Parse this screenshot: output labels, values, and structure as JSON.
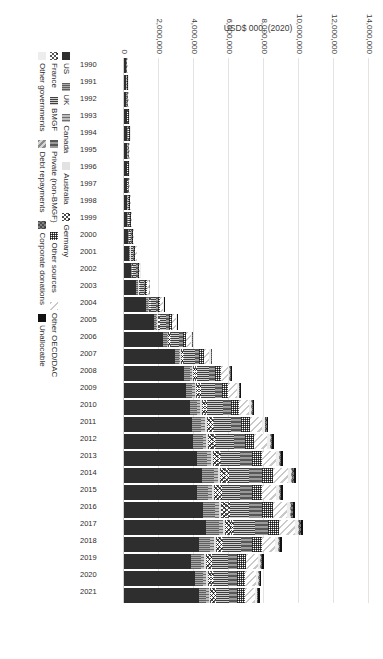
{
  "chart_data": {
    "type": "bar",
    "subtype": "stacked-horizontal-rotated",
    "title": "",
    "xlabel": "",
    "ylabel": "USD$ 000, (2020)",
    "ylim": [
      0,
      14000000
    ],
    "grid": true,
    "legend_position": "bottom",
    "yticks": [
      "0",
      "2,000,000",
      "4,000,000",
      "6,000,000",
      "8,000,000",
      "10,000,000",
      "12,000,000",
      "14,000,000"
    ],
    "ytick_values": [
      0,
      2000000,
      4000000,
      6000000,
      8000000,
      10000000,
      12000000,
      14000000
    ],
    "categories": [
      "1990",
      "1991",
      "1992",
      "1993",
      "1994",
      "1995",
      "1996",
      "1997",
      "1998",
      "1999",
      "2000",
      "2001",
      "2002",
      "2003",
      "2004",
      "2005",
      "2006",
      "2007",
      "2008",
      "2009",
      "2010",
      "2011",
      "2012",
      "2013",
      "2014",
      "2015",
      "2016",
      "2017",
      "2018",
      "2019",
      "2020",
      "2021"
    ],
    "series": [
      {
        "name": "US",
        "key": "us",
        "values": [
          95000,
          120000,
          140000,
          150000,
          185000,
          165000,
          150000,
          155000,
          165000,
          195000,
          235000,
          300000,
          390000,
          700000,
          1250000,
          1700000,
          2250000,
          2900000,
          3450000,
          3550000,
          3750000,
          3900000,
          3950000,
          4150000,
          4450000,
          4150000,
          4500000,
          4700000,
          4300000,
          3850000,
          4050000,
          4300000
        ]
      },
      {
        "name": "UK",
        "key": "uk",
        "values": [
          18000,
          20000,
          22000,
          25000,
          30000,
          28000,
          26000,
          28000,
          30000,
          33000,
          38000,
          45000,
          58000,
          80000,
          110000,
          140000,
          180000,
          230000,
          300000,
          360000,
          430000,
          520000,
          560000,
          610000,
          680000,
          640000,
          690000,
          720000,
          620000,
          540000,
          480000,
          400000
        ]
      },
      {
        "name": "Canada",
        "key": "canada",
        "values": [
          8000,
          9000,
          10000,
          11000,
          13000,
          12000,
          11000,
          12000,
          13000,
          14000,
          16000,
          19000,
          24000,
          33000,
          45000,
          58000,
          72000,
          90000,
          115000,
          135000,
          160000,
          190000,
          200000,
          215000,
          235000,
          215000,
          230000,
          240000,
          205000,
          180000,
          165000,
          150000
        ]
      },
      {
        "name": "Australia",
        "key": "australia",
        "values": [
          5000,
          5500,
          6000,
          6500,
          7500,
          7000,
          6500,
          7000,
          7500,
          8000,
          9000,
          11000,
          14000,
          19000,
          26000,
          33000,
          41000,
          52000,
          66000,
          78000,
          92000,
          110000,
          118000,
          126000,
          138000,
          125000,
          130000,
          135000,
          115000,
          98000,
          90000,
          82000
        ]
      },
      {
        "name": "Germany",
        "key": "germany",
        "values": [
          10000,
          11000,
          12000,
          13000,
          15000,
          14000,
          13000,
          14000,
          15000,
          17000,
          19000,
          23000,
          29000,
          40000,
          55000,
          70000,
          88000,
          110000,
          140000,
          165000,
          195000,
          235000,
          250000,
          268000,
          292000,
          268000,
          285000,
          300000,
          258000,
          225000,
          210000,
          195000
        ]
      },
      {
        "name": "France",
        "key": "france",
        "values": [
          7000,
          7500,
          8000,
          9000,
          10500,
          10000,
          9000,
          9500,
          10500,
          11500,
          13000,
          16000,
          20000,
          28000,
          38000,
          48000,
          60000,
          76000,
          97000,
          114000,
          135000,
          162000,
          173000,
          185000,
          202000,
          185000,
          197000,
          207000,
          178000,
          155000,
          145000,
          134000
        ]
      },
      {
        "name": "BMGF",
        "key": "bmgf",
        "values": [
          0,
          0,
          0,
          0,
          0,
          0,
          0,
          8000,
          22000,
          45000,
          85000,
          130000,
          175000,
          230000,
          300000,
          380000,
          470000,
          580000,
          700000,
          790000,
          880000,
          980000,
          1020000,
          1080000,
          1150000,
          1060000,
          1120000,
          1180000,
          1000000,
          870000,
          800000,
          740000
        ]
      },
      {
        "name": "Private (non-BMGF)",
        "key": "private",
        "values": [
          25000,
          27000,
          29000,
          32000,
          37000,
          35000,
          33000,
          35000,
          38000,
          42000,
          48000,
          58000,
          74000,
          100000,
          138000,
          175000,
          218000,
          275000,
          350000,
          412000,
          488000,
          585000,
          625000,
          668000,
          728000,
          668000,
          712000,
          748000,
          642000,
          560000,
          520000,
          480000
        ]
      },
      {
        "name": "Other sources",
        "key": "othersources",
        "values": [
          22000,
          24000,
          26000,
          28000,
          33000,
          31000,
          29000,
          31000,
          33000,
          37000,
          42000,
          51000,
          65000,
          88000,
          121000,
          154000,
          192000,
          242000,
          308000,
          362000,
          429000,
          515000,
          550000,
          588000,
          641000,
          588000,
          627000,
          658000,
          565000,
          493000,
          458000,
          422000
        ]
      },
      {
        "name": "Other OECD/DAC",
        "key": "otheroecd",
        "values": [
          30000,
          33000,
          35000,
          38000,
          45000,
          42000,
          39000,
          42000,
          45000,
          50000,
          57000,
          69000,
          88000,
          120000,
          165000,
          210000,
          262000,
          330000,
          420000,
          494000,
          585000,
          702000,
          750000,
          802000,
          874000,
          802000,
          855000,
          897000,
          770000,
          672000,
          625000,
          576000
        ]
      },
      {
        "name": "Other governments",
        "key": "othergov",
        "values": [
          6000,
          6500,
          7000,
          7500,
          9000,
          8500,
          8000,
          8500,
          9000,
          10000,
          11500,
          14000,
          18000,
          24000,
          33000,
          42000,
          52000,
          66000,
          84000,
          99000,
          117000,
          140000,
          150000,
          160000,
          175000,
          160000,
          171000,
          179000,
          154000,
          134000,
          125000,
          115000
        ]
      },
      {
        "name": "Debt repayments",
        "key": "debt",
        "values": [
          2000,
          2200,
          2400,
          2600,
          3000,
          2800,
          2600,
          2800,
          3000,
          3300,
          3800,
          4600,
          5900,
          8000,
          11000,
          14000,
          17500,
          22000,
          28000,
          33000,
          39000,
          47000,
          50000,
          53500,
          58000,
          53500,
          57000,
          60000,
          51000,
          45000,
          42000,
          38000
        ]
      },
      {
        "name": "Corporate donations",
        "key": "corporate",
        "values": [
          3000,
          3300,
          3600,
          3900,
          4500,
          4200,
          3900,
          4200,
          4500,
          5000,
          5700,
          6900,
          8800,
          12000,
          16500,
          21000,
          26000,
          33000,
          42000,
          49000,
          58000,
          70000,
          75000,
          80000,
          87000,
          80000,
          85000,
          89000,
          77000,
          67000,
          62000,
          57000
        ]
      },
      {
        "name": "Unallocable",
        "key": "unallocable",
        "values": [
          4000,
          4400,
          4800,
          5200,
          6000,
          5600,
          5200,
          5600,
          6000,
          6600,
          7600,
          9200,
          11700,
          16000,
          22000,
          28000,
          35000,
          44000,
          56000,
          66000,
          78000,
          94000,
          100000,
          107000,
          116000,
          107000,
          114000,
          119000,
          103000,
          90000,
          84000,
          77000
        ]
      }
    ]
  },
  "axis": {
    "value_axis_label": "USD$ 000, (2020)"
  },
  "legend": {
    "rows": [
      [
        {
          "label": "US",
          "key": "us"
        },
        {
          "label": "UK",
          "key": "uk"
        },
        {
          "label": "Canada",
          "key": "canada"
        },
        {
          "label": "Australia",
          "key": "australia"
        },
        {
          "label": "Germany",
          "key": "germany"
        }
      ],
      [
        {
          "label": "France",
          "key": "france"
        },
        {
          "label": "BMGF",
          "key": "bmgf"
        },
        {
          "label": "Private (non-BMGF)",
          "key": "private"
        },
        {
          "label": "Other sources",
          "key": "othersources"
        },
        {
          "label": "Other OECD/DAC",
          "key": "otheroecd"
        }
      ],
      [
        {
          "label": "Other governments",
          "key": "othergov"
        },
        {
          "label": "Debt repayments",
          "key": "debt"
        },
        {
          "label": "Corporate donations",
          "key": "corporate"
        },
        {
          "label": "Unallocable",
          "key": "unallocable"
        }
      ]
    ]
  }
}
